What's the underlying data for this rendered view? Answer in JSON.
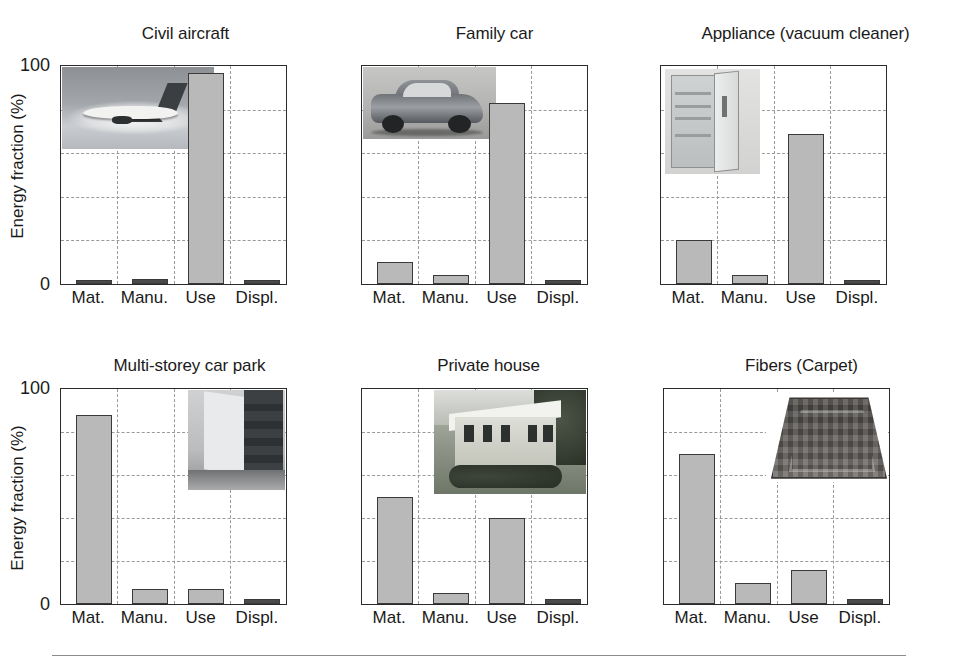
{
  "figure": {
    "axis_label_y": "Energy fraction (%)",
    "y_ticks": [
      "100",
      "0"
    ],
    "x_categories": [
      "Mat.",
      "Manu.",
      "Use",
      "Displ."
    ],
    "y_axis_range": [
      0,
      100
    ],
    "grid": "horizontal and vertical dashed gridlines at 20% intervals",
    "bar_fill_color": "#b9b9b9",
    "bar_edge_color": "#3a3a3a",
    "grid_color": "#9a9a9a",
    "axis_color": "#2a2a2a"
  },
  "panels": [
    {
      "id": "civil-aircraft",
      "title": "Civil aircraft",
      "inset_photo": "airplane-photo",
      "show_y_axis": true,
      "values": [
        2,
        2.5,
        97,
        2
      ]
    },
    {
      "id": "family-car",
      "title": "Family car",
      "inset_photo": "car-photo",
      "show_y_axis": false,
      "values": [
        10,
        4,
        83,
        2
      ]
    },
    {
      "id": "appliance-vacuum-cleaner",
      "title": "Appliance (vacuum cleaner)",
      "inset_photo": "refrigerator-photo",
      "show_y_axis": false,
      "values": [
        20,
        4,
        69,
        2
      ]
    },
    {
      "id": "multi-storey-car-park",
      "title": "Multi-storey car park",
      "inset_photo": "car-park-photo",
      "show_y_axis": true,
      "values": [
        88,
        7,
        7,
        2.5
      ]
    },
    {
      "id": "private-house",
      "title": "Private house",
      "inset_photo": "house-photo",
      "show_y_axis": false,
      "values": [
        50,
        5,
        40,
        2.5
      ]
    },
    {
      "id": "fibers-carpet",
      "title": "Fibers (Carpet)",
      "inset_photo": "carpet-photo",
      "show_y_axis": false,
      "values": [
        70,
        10,
        16,
        2.5
      ]
    }
  ],
  "chart_data": {
    "type": "bar",
    "title": "",
    "xlabel": "",
    "ylabel": "Energy fraction (%)",
    "ylim": [
      0,
      100
    ],
    "categories": [
      "Mat.",
      "Manu.",
      "Use",
      "Displ."
    ],
    "grid": true,
    "legend": "none",
    "panels": [
      {
        "title": "Civil aircraft",
        "values": [
          2,
          2.5,
          97,
          2
        ]
      },
      {
        "title": "Family car",
        "values": [
          10,
          4,
          83,
          2
        ]
      },
      {
        "title": "Appliance (vacuum cleaner)",
        "values": [
          20,
          4,
          69,
          2
        ]
      },
      {
        "title": "Multi-storey car park",
        "values": [
          88,
          7,
          7,
          2.5
        ]
      },
      {
        "title": "Private house",
        "values": [
          50,
          5,
          40,
          2.5
        ]
      },
      {
        "title": "Fibers (Carpet)",
        "values": [
          70,
          10,
          16,
          2.5
        ]
      }
    ],
    "y_ticks": [
      0,
      100
    ],
    "gridline_values": [
      20,
      40,
      60,
      80
    ]
  }
}
